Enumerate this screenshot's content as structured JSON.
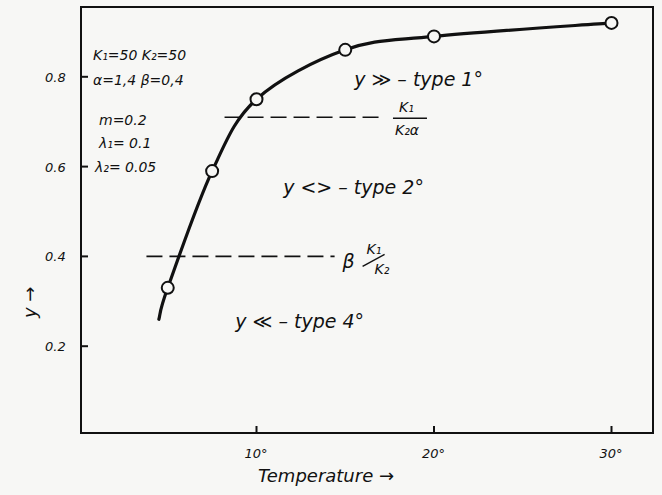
{
  "chart_data": {
    "type": "line",
    "title": "",
    "xlabel": "Temperature →",
    "ylabel": "y →",
    "xlim": [
      0,
      32
    ],
    "ylim": [
      0,
      0.96
    ],
    "grid": false,
    "x_ticks": [
      10,
      20,
      30
    ],
    "x_tick_labels": [
      "10°",
      "20°",
      "30°"
    ],
    "y_ticks": [
      0.2,
      0.4,
      0.6,
      0.8
    ],
    "y_tick_labels": [
      "0.2",
      "0.4",
      "0.6",
      "0.8"
    ],
    "series": [
      {
        "name": "y vs Temperature",
        "marker": "open-circle",
        "x": [
          5,
          7.5,
          10,
          15,
          20,
          30
        ],
        "values": [
          0.33,
          0.59,
          0.75,
          0.86,
          0.89,
          0.92
        ]
      }
    ],
    "curve_start": {
      "x": 4.5,
      "y": 0.26
    },
    "reference_lines": [
      {
        "name": "upper-threshold",
        "y": 0.71,
        "x_from": 8.2,
        "x_to": 16.9,
        "style": "dashed",
        "label_num": "K₁",
        "label_den": "K₂α"
      },
      {
        "name": "lower-threshold",
        "y": 0.4,
        "x_from": 3.8,
        "x_to": 14.4,
        "style": "dashed",
        "label_prefix": "β",
        "label_num": "K₁",
        "label_den": "K₂"
      }
    ],
    "annotations": {
      "params": [
        "K₁=50   K₂=50",
        "α=1,4   β=0,4",
        "m=0.2",
        "λ₁= 0.1",
        "λ₂= 0.05"
      ],
      "regions": [
        {
          "text": "y ≫  – type 1°",
          "x": 15.5,
          "y": 0.78
        },
        {
          "text": "y <>  – type 2°",
          "x": 11.5,
          "y": 0.54
        },
        {
          "text": "y  ≪ – type 4°",
          "x": 8.8,
          "y": 0.24
        }
      ]
    }
  }
}
